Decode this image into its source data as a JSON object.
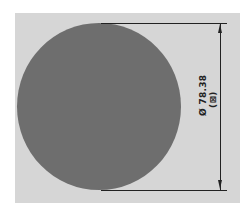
{
  "drawing": {
    "shape": "circle",
    "fill_color": "#6e6e6e",
    "background_color": "#d6d6d6",
    "dimension": {
      "symbol": "Ø",
      "value": "78.38",
      "label": "Ø 78.38",
      "reference": "(⊠)",
      "orientation": "vertical"
    }
  }
}
